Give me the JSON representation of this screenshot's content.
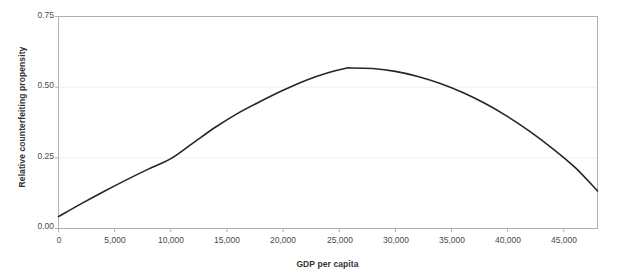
{
  "chart_data": {
    "type": "line",
    "title": "",
    "xlabel": "GDP per capita",
    "ylabel": "Relative counterfeiting propensity",
    "xlim": [
      0,
      48000
    ],
    "ylim": [
      0.0,
      0.75
    ],
    "grid": true,
    "legend": "none",
    "line_color": "#262626",
    "axis_color": "#b0b0b0",
    "grid_color": "#eeeeee",
    "background": "#ffffff",
    "xticks": [
      0,
      5000,
      10000,
      15000,
      20000,
      25000,
      30000,
      35000,
      40000,
      45000
    ],
    "xtick_labels": [
      "0",
      "5,000",
      "10,000",
      "15,000",
      "20,000",
      "25,000",
      "30,000",
      "35,000",
      "40,000",
      "45,000"
    ],
    "yticks": [
      0.0,
      0.25,
      0.5,
      0.75
    ],
    "ytick_labels": [
      "0.00",
      "0.25",
      "0.50",
      "0.75"
    ],
    "series": [
      {
        "name": "Relative counterfeiting propensity",
        "x": [
          0,
          2000,
          4000,
          6000,
          8000,
          10000,
          12000,
          14000,
          16000,
          18000,
          20000,
          22000,
          24000,
          25500,
          26000,
          28000,
          30000,
          32000,
          34000,
          36000,
          38000,
          40000,
          42000,
          44000,
          46000,
          48000
        ],
        "y": [
          0.042,
          0.087,
          0.13,
          0.171,
          0.21,
          0.247,
          0.303,
          0.359,
          0.408,
          0.45,
          0.489,
          0.524,
          0.551,
          0.566,
          0.568,
          0.566,
          0.556,
          0.538,
          0.513,
          0.481,
          0.442,
          0.396,
          0.343,
          0.283,
          0.216,
          0.133
        ]
      }
    ],
    "annotations": []
  }
}
